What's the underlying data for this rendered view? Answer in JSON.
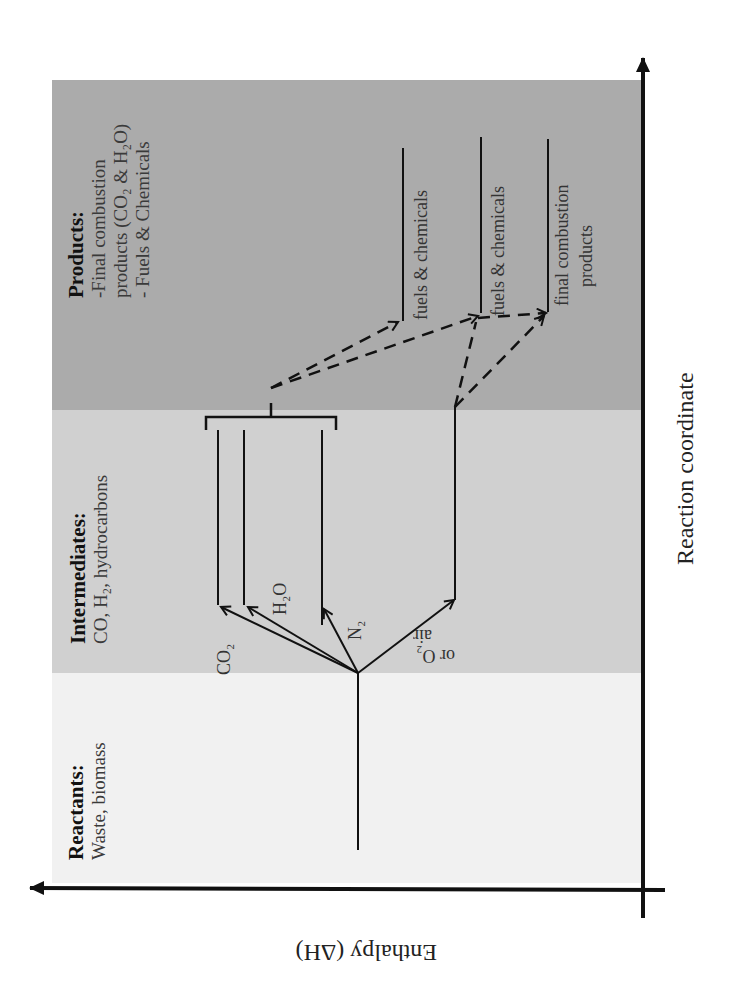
{
  "diagram": {
    "type": "enthalpy_reaction_diagram",
    "orientation": "rotated_90_ccw",
    "axes": {
      "enthalpy_label": "Enthalpy (ΔH)",
      "reaction_coordinate_label": "Reaction coordinate"
    },
    "zones": [
      {
        "id": "reactants",
        "title": "Reactants:",
        "lines": [
          "Waste, biomass"
        ],
        "color": "#f1f1f1"
      },
      {
        "id": "intermediates",
        "title": "Intermediates:",
        "lines": [
          "CO, H₂, hydrocarbons"
        ],
        "color": "#d0d0d0"
      },
      {
        "id": "products",
        "title": "Products:",
        "lines": [
          "-Final combustion",
          "products (CO₂ & H₂O)",
          " - Fuels & Chemicals"
        ],
        "color": "#ababab"
      }
    ],
    "branch_labels": {
      "co2": "CO₂",
      "h2o": "H₂O",
      "n2": "N₂",
      "air_line1": "air",
      "air_line2": "or O₂"
    },
    "product_levels": {
      "fuels1": "fuels & chemicals",
      "fuels2": "fuels & chemicals",
      "final_line1": "final combustion",
      "final_line2": "products"
    },
    "colors": {
      "line": "#111111",
      "axis": "#111111",
      "background": "#ffffff"
    }
  }
}
